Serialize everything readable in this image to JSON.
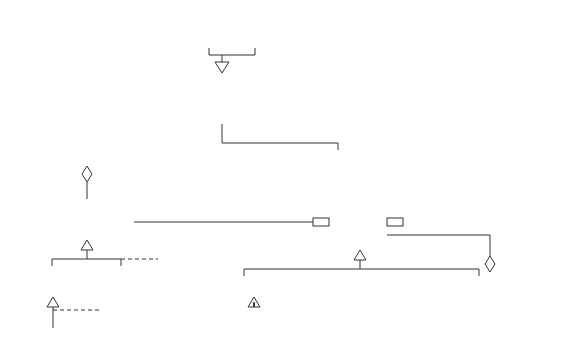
{
  "diagram": {
    "type": "UML class diagram",
    "classes": {
      "store_in_layers": [
        "StoreIn",
        "Layers"
      ],
      "store_in_piles": [
        "StoreIn",
        "Piles"
      ],
      "storage_strategy": {
        "name": [
          "Storage",
          "Strategy"
        ],
        "ops": [
          "store",
          "fetch"
        ]
      },
      "soc_factory": [
        "SOC",
        "Factory"
      ],
      "soc": "SOC",
      "storage": {
        "name": "Storage",
        "ops": [
          "store",
          "fetch",
          "capacity",
          "..."
        ]
      },
      "throughput_class": [
        "Throughput",
        "Class"
      ],
      "hazardous_class": [
        "Hazardous",
        "Class"
      ],
      "fast_runner": [
        "Fast",
        "Runner"
      ],
      "atomic_storage": [
        "Atomic",
        "Storage"
      ],
      "aggregate_storage": [
        "Aggregate",
        "Storage"
      ],
      "bin": "Bin",
      "door": "Door",
      "cart": "Cart",
      "aisle": "Aisle",
      "side": "Side",
      "train": "Train"
    },
    "labels": {
      "uses": "uses",
      "soc_role": "SOC",
      "soc_mult": "*",
      "n": "n",
      "soc_vector": "SOC vector",
      "parent": "parent",
      "transport_mult": "*",
      "transportation": "transportation",
      "facility": "facility",
      "aggregated_mult": "*",
      "aggregated_storage": "aggregated storage",
      "further_soc_1": [
        "further",
        "SOC",
        "types"
      ],
      "further_soc_2": [
        "further",
        "SOC",
        "types"
      ],
      "further_storage": [
        "further",
        "storage",
        "types"
      ]
    }
  }
}
